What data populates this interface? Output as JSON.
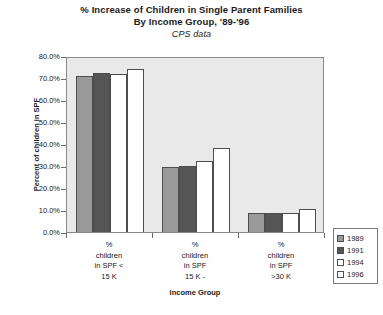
{
  "chart_data": {
    "type": "bar",
    "title": "% Increase of Children in Single Parent Families",
    "title_line2": "By Income Group, '89-'96",
    "subtitle": "CPS data",
    "xlabel": "Income Group",
    "ylabel": "Percent of children in SPF",
    "ylim": [
      0,
      80
    ],
    "ytick_labels": [
      "80.0%",
      "70.0%",
      "60.0%",
      "50.0%",
      "40.0%",
      "30.0%",
      "20.0%",
      "10.0%",
      "0.0%"
    ],
    "ytick_values": [
      80,
      70,
      60,
      50,
      40,
      30,
      20,
      10,
      0
    ],
    "grid": false,
    "legend_position": "right-bottom",
    "categories": [
      "% children in SPF < 15 K",
      "% children in SPF 15 K -",
      "% children in SPF >30  K"
    ],
    "category_lines": [
      [
        "%",
        "children",
        "in SPF <",
        "15 K"
      ],
      [
        "%",
        "children",
        "in SPF",
        "15 K -"
      ],
      [
        "%",
        "children",
        "in SPF",
        ">30  K"
      ]
    ],
    "series": [
      {
        "name": "1989",
        "color": "#9a9a9a",
        "values": [
          71.0,
          29.5,
          8.5
        ]
      },
      {
        "name": "1991",
        "color": "#555555",
        "values": [
          72.5,
          30.0,
          8.6
        ]
      },
      {
        "name": "1994",
        "color": "#ffffff",
        "values": [
          71.8,
          32.5,
          8.8
        ]
      },
      {
        "name": "1996",
        "color": "#ffffff",
        "values": [
          74.0,
          38.0,
          10.5
        ]
      }
    ]
  },
  "legend": {
    "items": [
      {
        "label": "1989"
      },
      {
        "label": "1991"
      },
      {
        "label": "1994"
      },
      {
        "label": "1996"
      }
    ]
  }
}
